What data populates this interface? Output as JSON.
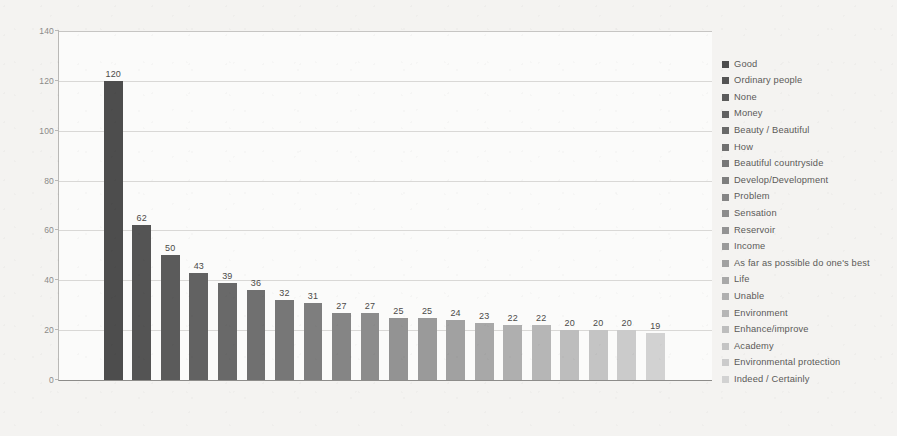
{
  "chart_data": {
    "type": "bar",
    "title": "",
    "subtitle": "",
    "xlabel": "",
    "ylabel": "",
    "ylim": [
      0,
      140
    ],
    "ytick_labels": [
      "140",
      "120",
      "100",
      "80",
      "60",
      "40",
      "20",
      "0"
    ],
    "ytick_values": [
      140,
      120,
      100,
      80,
      60,
      40,
      20,
      0
    ],
    "grid": true,
    "legend_position": "right",
    "categories": [
      "Good",
      "Ordinary people",
      "None",
      "Money",
      "Beauty / Beautiful",
      "How",
      "Beautiful countryside",
      "Develop/Development",
      "Problem",
      "Sensation",
      "Reservoir",
      "Income",
      "As far as possible do one's best",
      "Life",
      "Unable",
      "Environment",
      "Enhance/improve",
      "Academy",
      "Environmental protection",
      "Indeed / Certainly"
    ],
    "values": [
      120,
      62,
      50,
      43,
      39,
      36,
      32,
      31,
      27,
      27,
      25,
      25,
      24,
      23,
      22,
      22,
      20,
      20,
      20,
      19
    ],
    "bar_colors": [
      "#4d4d4d",
      "#545454",
      "#5b5b5b",
      "#626262",
      "#696969",
      "#707070",
      "#777777",
      "#7e7e7e",
      "#858585",
      "#8c8c8c",
      "#939393",
      "#9a9a9a",
      "#a1a1a1",
      "#a8a8a8",
      "#afafaf",
      "#b6b6b6",
      "#bdbdbd",
      "#c4c4c4",
      "#cbcbcb",
      "#d2d2d2"
    ],
    "data_labels": [
      "120",
      "62",
      "50",
      "43",
      "39",
      "36",
      "32",
      "31",
      "27",
      "27",
      "25",
      "25",
      "24",
      "23",
      "22",
      "22",
      "20",
      "20",
      "20",
      "19"
    ]
  },
  "legend": {
    "items": [
      {
        "label": "Good",
        "color": "#4d4d4d"
      },
      {
        "label": "Ordinary people",
        "color": "#545454"
      },
      {
        "label": "None",
        "color": "#5b5b5b"
      },
      {
        "label": "Money",
        "color": "#626262"
      },
      {
        "label": "Beauty / Beautiful",
        "color": "#696969"
      },
      {
        "label": "How",
        "color": "#707070"
      },
      {
        "label": "Beautiful countryside",
        "color": "#777777"
      },
      {
        "label": "Develop/Development",
        "color": "#7e7e7e"
      },
      {
        "label": "Problem",
        "color": "#858585"
      },
      {
        "label": "Sensation",
        "color": "#8c8c8c"
      },
      {
        "label": "Reservoir",
        "color": "#939393"
      },
      {
        "label": "Income",
        "color": "#9a9a9a"
      },
      {
        "label": "As far as possible do one's best",
        "color": "#a1a1a1"
      },
      {
        "label": "Life",
        "color": "#a8a8a8"
      },
      {
        "label": "Unable",
        "color": "#afafaf"
      },
      {
        "label": "Environment",
        "color": "#b6b6b6"
      },
      {
        "label": "Enhance/improve",
        "color": "#bdbdbd"
      },
      {
        "label": "Academy",
        "color": "#c4c4c4"
      },
      {
        "label": "Environmental protection",
        "color": "#cbcbcb"
      },
      {
        "label": "Indeed / Certainly",
        "color": "#d2d2d2"
      }
    ]
  },
  "colors": {
    "page_background": "#f4f3f1",
    "plot_background": "#fbfbfa",
    "gridline": "#d9d8d6",
    "axis": "#8d8c8a",
    "tick_text": "#8b8a88",
    "data_label_text": "#4b4a48",
    "legend_text": "#5b5a58"
  }
}
